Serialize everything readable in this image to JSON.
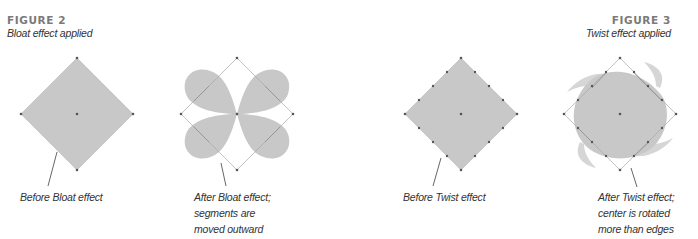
{
  "figure2": {
    "label": "FIGURE 2",
    "subtitle": "Bloat effect applied",
    "before_caption": [
      "Before Bloat effect"
    ],
    "after_caption": [
      "After Bloat effect;",
      "segments are",
      "moved outward"
    ]
  },
  "figure3": {
    "label": "FIGURE 3",
    "subtitle": "Twist effect applied",
    "before_caption": [
      "Before Twist effect"
    ],
    "after_caption": [
      "After Twist effect;",
      "center is rotated",
      "more than edges"
    ]
  },
  "colors": {
    "shape_fill": "#c8c8c8",
    "outline": "#9a9a9a",
    "anchor": "#555555",
    "heading": "#7a7a7a",
    "caption": "#333333"
  }
}
